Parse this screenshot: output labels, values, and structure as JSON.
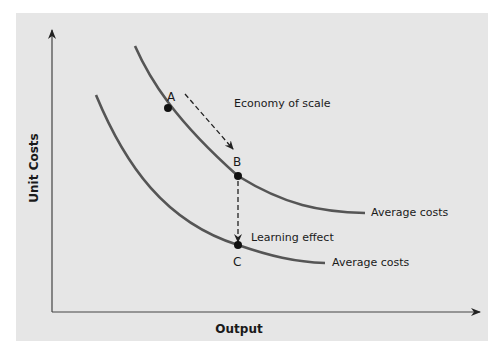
{
  "diagram": {
    "y_axis_label": "Unit Costs",
    "x_axis_label": "Output",
    "annotations": {
      "economy_of_scale": "Economy of scale",
      "learning_effect": "Learning effect"
    },
    "curves": [
      {
        "name": "upper",
        "label": "Average costs"
      },
      {
        "name": "lower",
        "label": "Average costs"
      }
    ],
    "points": [
      {
        "label": "A"
      },
      {
        "label": "B"
      },
      {
        "label": "C"
      }
    ],
    "colors": {
      "background": "#e6e6e6",
      "curve": "#555555",
      "axis": "#444444",
      "point": "#111111"
    }
  }
}
